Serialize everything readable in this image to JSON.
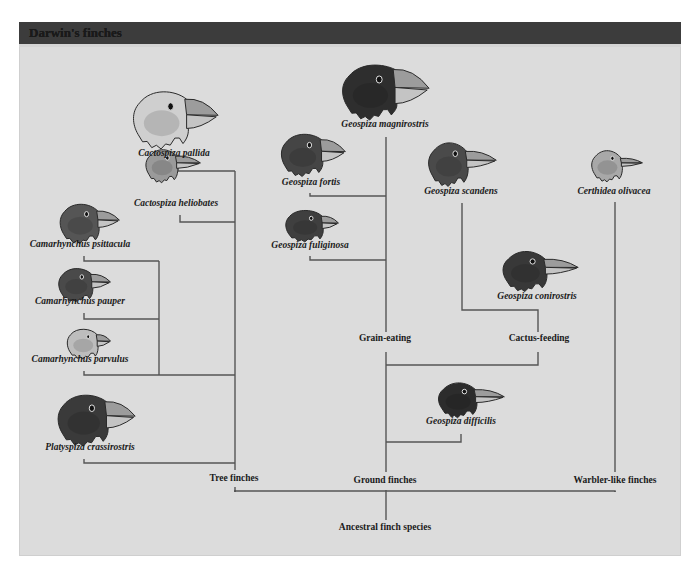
{
  "title": "Darwin's finches",
  "colors": {
    "background": "#dcdcdc",
    "header": "#3c3c3c",
    "line": "#555555",
    "text": "#1a1a1a"
  },
  "species": [
    {
      "id": "cactospiza-pallida",
      "name": "Cactospiza pallida",
      "label_x": 174,
      "label_y": 156,
      "bird": {
        "x": 129,
        "y": 86,
        "w": 90,
        "h": 65,
        "tone": "#cfcfcf",
        "beak": "large"
      }
    },
    {
      "id": "cactospiza-heliobates",
      "name": "Cactospiza heliobates",
      "label_x": 176,
      "label_y": 206,
      "bird": {
        "x": 143,
        "y": 146,
        "w": 58,
        "h": 38,
        "tone": "#9a9a9a",
        "beak": "long"
      }
    },
    {
      "id": "camarhynchus-psittacula",
      "name": "Camarhynchus psittacula",
      "label_x": 80,
      "label_y": 247,
      "bird": {
        "x": 57,
        "y": 200,
        "w": 63,
        "h": 45,
        "tone": "#555555",
        "beak": "medium"
      }
    },
    {
      "id": "camarhynchus-pauper",
      "name": "Camarhynchus pauper",
      "label_x": 80,
      "label_y": 304,
      "bird": {
        "x": 56,
        "y": 265,
        "w": 55,
        "h": 38,
        "tone": "#4a4a4a",
        "beak": "medium"
      }
    },
    {
      "id": "camarhynchus-parvulus",
      "name": "Camarhynchus parvulus",
      "label_x": 80,
      "label_y": 362,
      "bird": {
        "x": 65,
        "y": 326,
        "w": 46,
        "h": 34,
        "tone": "#bdbdbd",
        "beak": "small"
      }
    },
    {
      "id": "platyspiza-crassirostris",
      "name": "Platyspiza crassirostris",
      "label_x": 90,
      "label_y": 450,
      "bird": {
        "x": 54,
        "y": 390,
        "w": 82,
        "h": 58,
        "tone": "#3a3a3a",
        "beak": "large"
      }
    },
    {
      "id": "geospiza-magnirostris",
      "name": "Geospiza magnirostris",
      "label_x": 385,
      "label_y": 127,
      "bird": {
        "x": 338,
        "y": 60,
        "w": 92,
        "h": 62,
        "tone": "#2e2e2e",
        "beak": "huge"
      }
    },
    {
      "id": "geospiza-fortis",
      "name": "Geospiza fortis",
      "label_x": 311,
      "label_y": 185,
      "bird": {
        "x": 278,
        "y": 130,
        "w": 68,
        "h": 48,
        "tone": "#454545",
        "beak": "large"
      }
    },
    {
      "id": "geospiza-fuliginosa",
      "name": "Geospiza fuliginosa",
      "label_x": 310,
      "label_y": 248,
      "bird": {
        "x": 283,
        "y": 207,
        "w": 56,
        "h": 36,
        "tone": "#3f3f3f",
        "beak": "small"
      }
    },
    {
      "id": "geospiza-scandens",
      "name": "Geospiza scandens",
      "label_x": 461,
      "label_y": 194,
      "bird": {
        "x": 425,
        "y": 138,
        "w": 72,
        "h": 50,
        "tone": "#4a4a4a",
        "beak": "long"
      }
    },
    {
      "id": "geospiza-conirostris",
      "name": "Geospiza conirostris",
      "label_x": 537,
      "label_y": 299,
      "bird": {
        "x": 499,
        "y": 247,
        "w": 80,
        "h": 46,
        "tone": "#383838",
        "beak": "long"
      }
    },
    {
      "id": "geospiza-difficilis",
      "name": "Geospiza difficilis",
      "label_x": 461,
      "label_y": 424,
      "bird": {
        "x": 435,
        "y": 379,
        "w": 70,
        "h": 40,
        "tone": "#2c2c2c",
        "beak": "long"
      }
    },
    {
      "id": "certhidea-olivacea",
      "name": "Certhidea olivacea",
      "label_x": 614,
      "label_y": 194,
      "bird": {
        "x": 589,
        "y": 147,
        "w": 54,
        "h": 36,
        "tone": "#a8a8a8",
        "beak": "thin"
      }
    }
  ],
  "groups": [
    {
      "id": "tree-finches",
      "name": "Tree finches",
      "x": 234,
      "y": 481
    },
    {
      "id": "ground-finches",
      "name": "Ground finches",
      "x": 385,
      "y": 483
    },
    {
      "id": "warbler-like-finches",
      "name": "Warbler-like finches",
      "x": 615,
      "y": 483
    },
    {
      "id": "grain-eating",
      "name": "Grain-eating",
      "x": 385,
      "y": 341
    },
    {
      "id": "cactus-feeding",
      "name": "Cactus-feeding",
      "x": 539,
      "y": 341
    },
    {
      "id": "ancestral-finch-species",
      "name": "Ancestral finch species",
      "x": 385,
      "y": 530
    }
  ],
  "branches": [
    "M 178 165 L 178 171 L 235 171",
    "M 180 215 L 180 222 L 235 222",
    "M 84 256 L 84 261 L 159 261",
    "M 84 313 L 84 319 L 159 319",
    "M 84 371 L 84 375 L 235 375",
    "M 159 261 L 159 375",
    "M 84 459 L 84 463 L 235 463",
    "M 235 171 L 235 470",
    "M 235 492 L 235 490 L 235 487",
    "M 386 137 L 386 332",
    "M 310 193 L 310 196 L 386 196",
    "M 310 256 L 310 260 L 386 260",
    "M 386 352 L 386 472",
    "M 386 365 L 538 365 L 538 352",
    "M 462 203 L 462 310 L 538 310 L 538 332",
    "M 386 442 L 461 442 L 461 434",
    "M 615 202 L 615 472",
    "M 235 492 L 235 491 L 615 491 L 615 492",
    "M 235 490 L 235 492",
    "M 386 490 L 386 520",
    "M 615 491 L 615 492"
  ]
}
